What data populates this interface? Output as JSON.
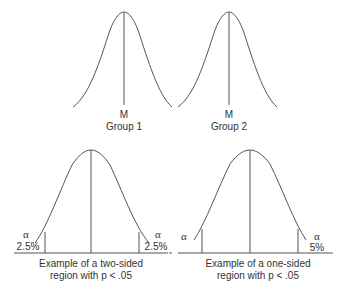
{
  "panels": {
    "group1": {
      "mean_label": "M",
      "group_label": "Group 1"
    },
    "group2": {
      "mean_label": "M",
      "group_label": "Group 2"
    },
    "two_sided": {
      "left_alpha": "α",
      "left_pct": "2.5%",
      "right_alpha": "α",
      "right_pct": "2.5%",
      "caption_line1": "Example of a two-sided",
      "caption_line2": "region with  p < .05"
    },
    "one_sided": {
      "left_alpha": "α",
      "right_alpha": "α",
      "right_pct": "5%",
      "caption_line1": "Example of a one-sided",
      "caption_line2": "region with p < .05"
    }
  },
  "colors": {
    "line": "#555555",
    "text": "#333333"
  }
}
